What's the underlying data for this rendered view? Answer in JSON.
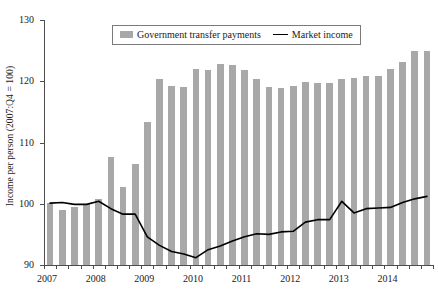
{
  "chart_data": {
    "type": "bar",
    "title": "",
    "subtitle": "",
    "xlabel": "",
    "ylabel": "Income per person (2007:Q4 = 100)",
    "ylim": [
      90,
      130
    ],
    "ytick_labels": [
      "90",
      "100",
      "110",
      "120",
      "130"
    ],
    "ytick_values": [
      90,
      100,
      110,
      120,
      130
    ],
    "xtick_labels": [
      "2007",
      "2008",
      "2009",
      "2010",
      "2011",
      "2012",
      "2013",
      "2014"
    ],
    "xtick_values": [
      2007,
      2008,
      2009,
      2010,
      2011,
      2012,
      2013,
      2014
    ],
    "grid": false,
    "legend_position": "top-center",
    "categories": [
      "2007:Q1",
      "2007:Q2",
      "2007:Q3",
      "2007:Q4",
      "2008:Q1",
      "2008:Q2",
      "2008:Q3",
      "2008:Q4",
      "2009:Q1",
      "2009:Q2",
      "2009:Q3",
      "2009:Q4",
      "2010:Q1",
      "2010:Q2",
      "2010:Q3",
      "2010:Q4",
      "2011:Q1",
      "2011:Q2",
      "2011:Q3",
      "2011:Q4",
      "2012:Q1",
      "2012:Q2",
      "2012:Q3",
      "2012:Q4",
      "2013:Q1",
      "2013:Q2",
      "2013:Q3",
      "2013:Q4",
      "2014:Q1",
      "2014:Q2",
      "2014:Q3",
      "2014:Q4"
    ],
    "series": [
      {
        "name": "Government transfer payments",
        "type": "bar",
        "color": "#a8a8a8",
        "values": [
          100.1,
          99.0,
          99.5,
          100.0,
          100.8,
          107.7,
          102.8,
          106.5,
          113.3,
          120.4,
          119.2,
          119.1,
          122.0,
          121.9,
          122.8,
          122.6,
          121.8,
          120.3,
          119.0,
          118.9,
          119.2,
          119.9,
          119.7,
          119.8,
          120.4,
          120.6,
          120.9,
          120.8,
          122.0,
          123.1,
          124.9,
          124.9
        ]
      },
      {
        "name": "Market income",
        "type": "line",
        "color": "#000000",
        "values": [
          100.1,
          100.2,
          99.9,
          99.9,
          100.4,
          99.2,
          98.3,
          98.3,
          94.6,
          93.2,
          92.2,
          91.8,
          91.2,
          92.5,
          93.1,
          93.9,
          94.6,
          95.1,
          95.0,
          95.4,
          95.5,
          97.0,
          97.4,
          97.4,
          100.4,
          98.5,
          99.2,
          99.3,
          99.4,
          100.2,
          100.8,
          101.2
        ]
      }
    ],
    "legend": [
      {
        "label": "Government transfer payments",
        "marker": "bar-swatch-icon",
        "color": "#a8a8a8"
      },
      {
        "label": "Market income",
        "marker": "line-swatch-icon",
        "color": "#000000"
      }
    ]
  }
}
